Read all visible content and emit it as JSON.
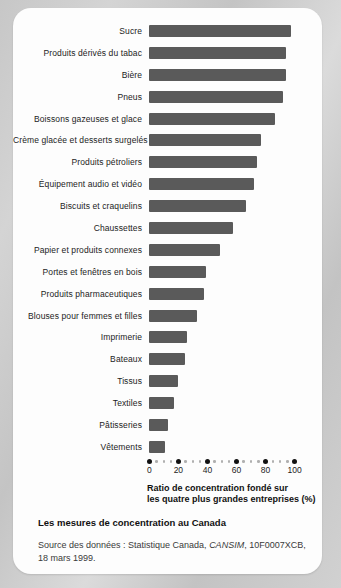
{
  "chart_data": {
    "type": "bar",
    "orientation": "horizontal",
    "categories": [
      "Sucre",
      "Produits dérivés du tabac",
      "Bière",
      "Pneus",
      "Boissons gazeuses et glace",
      "Crème glacée et desserts surgelés",
      "Produits pétroliers",
      "Équipement audio et vidéo",
      "Biscuits et craquelins",
      "Chaussettes",
      "Papier et produits connexes",
      "Portes et fenêtres en bois",
      "Produits pharmaceutiques",
      "Blouses pour femmes et filles",
      "Imprimerie",
      "Bateaux",
      "Tissus",
      "Textiles",
      "Pâtisseries",
      "Vêtements"
    ],
    "values": [
      98,
      94,
      94,
      92,
      87,
      77,
      74,
      72,
      67,
      58,
      49,
      39,
      38,
      33,
      26,
      25,
      20,
      17,
      13,
      11
    ],
    "xlabel": "Ratio de concentration fondé sur les quatre plus grandes entreprises (%)",
    "xlim": [
      0,
      100
    ],
    "xticks": [
      0,
      20,
      40,
      60,
      80,
      100
    ],
    "grid": false,
    "legend": "none"
  },
  "axis_caption": {
    "line1": "Ratio de concentration fondé sur",
    "line2": "les quatre plus grandes entreprises (%)"
  },
  "footer": {
    "figure_title": "Les mesures de concentration au Canada",
    "source_prefix": "Source des données : Statistique Canada, ",
    "source_emphasis": "CANSIM",
    "source_suffix": ", 10F0007XCB,",
    "source_line2": "18 mars 1999."
  },
  "colors": {
    "bar": "#5a5a5a",
    "card_background": "#fdfdfd",
    "page_background": "#cccccc",
    "axis_dot": "#111111",
    "axis_minor_dot": "#b0b0b0",
    "text": "#1c1c1c"
  }
}
